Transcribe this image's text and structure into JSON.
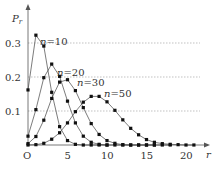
{
  "chart_data": {
    "type": "line",
    "title": "",
    "xlabel": "r",
    "ylabel": "Pr",
    "origin_label": "O",
    "xlim": [
      0,
      22
    ],
    "ylim": [
      0,
      0.35
    ],
    "x_ticks": [
      5,
      10,
      15,
      20
    ],
    "y_ticks": [
      0.1,
      0.2,
      0.3
    ],
    "y_tick_labels": [
      "0.1",
      "0.2",
      "0.3"
    ],
    "x_tick_labels": [
      "5",
      "10",
      "15",
      "20"
    ],
    "grid": "horizontal dotted at 0.1, 0.2, 0.3",
    "legend": "inline labels",
    "series": [
      {
        "name": "n=10",
        "label_n": "n",
        "label_val": "=10",
        "x": [
          0,
          1,
          2,
          3,
          4,
          5,
          6,
          7,
          8,
          9,
          10
        ],
        "values": [
          0.162,
          0.323,
          0.291,
          0.155,
          0.054,
          0.013,
          0.002,
          0.0,
          0.0,
          0.0,
          0.0
        ]
      },
      {
        "name": "n=20",
        "label_n": "n",
        "label_val": "=20",
        "x": [
          0,
          1,
          2,
          3,
          4,
          5,
          6,
          7,
          8,
          9,
          10,
          11,
          12,
          13,
          14,
          15,
          16
        ],
        "values": [
          0.026,
          0.104,
          0.198,
          0.238,
          0.202,
          0.129,
          0.065,
          0.026,
          0.008,
          0.002,
          0.0,
          0.0,
          0.0,
          0.0,
          0.0,
          0.0,
          0.0
        ]
      },
      {
        "name": "n=30",
        "label_n": "n",
        "label_val": "=30",
        "x": [
          0,
          1,
          2,
          3,
          4,
          5,
          6,
          7,
          8,
          9,
          10,
          11,
          12,
          13,
          14,
          15,
          16,
          17,
          18
        ],
        "values": [
          0.004,
          0.025,
          0.073,
          0.137,
          0.185,
          0.192,
          0.16,
          0.11,
          0.063,
          0.031,
          0.013,
          0.005,
          0.001,
          0.0,
          0.0,
          0.0,
          0.0,
          0.0,
          0.0
        ]
      },
      {
        "name": "n=50",
        "label_n": "n",
        "label_val": "=50",
        "x": [
          0,
          1,
          2,
          3,
          4,
          5,
          6,
          7,
          8,
          9,
          10,
          11,
          12,
          13,
          14,
          15,
          16,
          17,
          18,
          19,
          20,
          21
        ],
        "values": [
          0.0,
          0.001,
          0.005,
          0.017,
          0.036,
          0.065,
          0.098,
          0.126,
          0.143,
          0.143,
          0.127,
          0.102,
          0.074,
          0.049,
          0.03,
          0.016,
          0.008,
          0.004,
          0.002,
          0.001,
          0.0,
          0.0
        ]
      }
    ]
  }
}
